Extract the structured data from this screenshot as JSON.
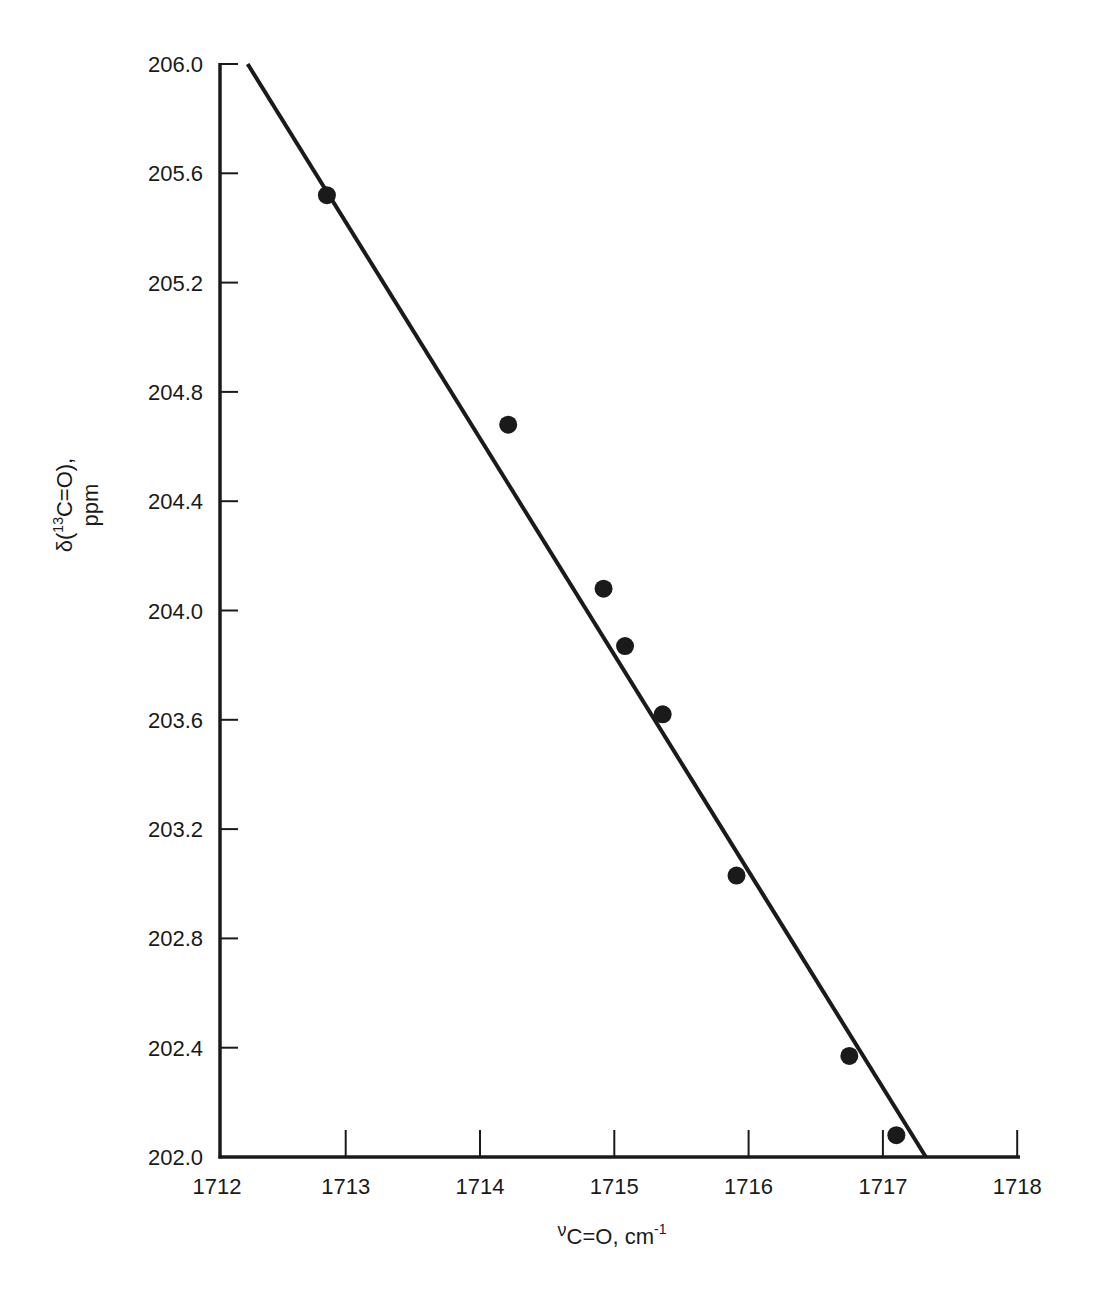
{
  "chart_data": {
    "type": "scatter",
    "title": "",
    "xlabel": "νC=O, cm-1",
    "xlabel_parts": {
      "nu": "ν",
      "main": "C=O, cm",
      "sup": "-1"
    },
    "ylabel": "δ(13C=O), ppm",
    "ylabel_parts": {
      "line1_pre": "δ(",
      "line1_sup": "13",
      "line1_post": "C=O),",
      "line2": "ppm"
    },
    "xlim": [
      1712,
      1718
    ],
    "ylim": [
      202.0,
      206.0
    ],
    "x_ticks": [
      "1712",
      "1713",
      "1714",
      "1715",
      "1716",
      "1717",
      "1718"
    ],
    "y_ticks": [
      "206.0",
      "205.6",
      "205.2",
      "204.8",
      "204.4",
      "204.0",
      "203.6",
      "203.2",
      "202.8",
      "202.4",
      "202.0"
    ],
    "grid": false,
    "legend": null,
    "series": [
      {
        "name": "data",
        "marker": "filled-circle",
        "points": [
          {
            "x": 1712.86,
            "y": 205.52
          },
          {
            "x": 1714.21,
            "y": 204.68
          },
          {
            "x": 1714.92,
            "y": 204.08
          },
          {
            "x": 1715.08,
            "y": 203.87
          },
          {
            "x": 1715.36,
            "y": 203.62
          },
          {
            "x": 1715.91,
            "y": 203.03
          },
          {
            "x": 1716.75,
            "y": 202.37
          },
          {
            "x": 1717.1,
            "y": 202.08
          }
        ]
      },
      {
        "name": "linear fit",
        "type": "line",
        "points": [
          {
            "x": 1712.27,
            "y": 206.0
          },
          {
            "x": 1717.32,
            "y": 202.0
          }
        ]
      }
    ]
  },
  "colors": {
    "ink": "#1a1a1a",
    "background": "#ffffff"
  }
}
